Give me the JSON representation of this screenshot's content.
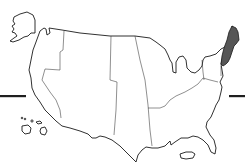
{
  "map": {
    "subject": "United States regions",
    "highlighted_region": "New England",
    "highlight_style": "crosshatch",
    "highlight_color": "#2b2b2b",
    "outline_color": "#1a1a1a",
    "background_color": "#ffffff",
    "insets": [
      "Alaska",
      "Hawaii",
      "Puerto Rico"
    ],
    "regions": [
      "Pacific Coast",
      "Mountain West",
      "Great Plains",
      "Midwest",
      "Northeast",
      "South",
      "New England"
    ],
    "decorations": [
      "left-horizontal-bar",
      "right-horizontal-bar"
    ]
  }
}
